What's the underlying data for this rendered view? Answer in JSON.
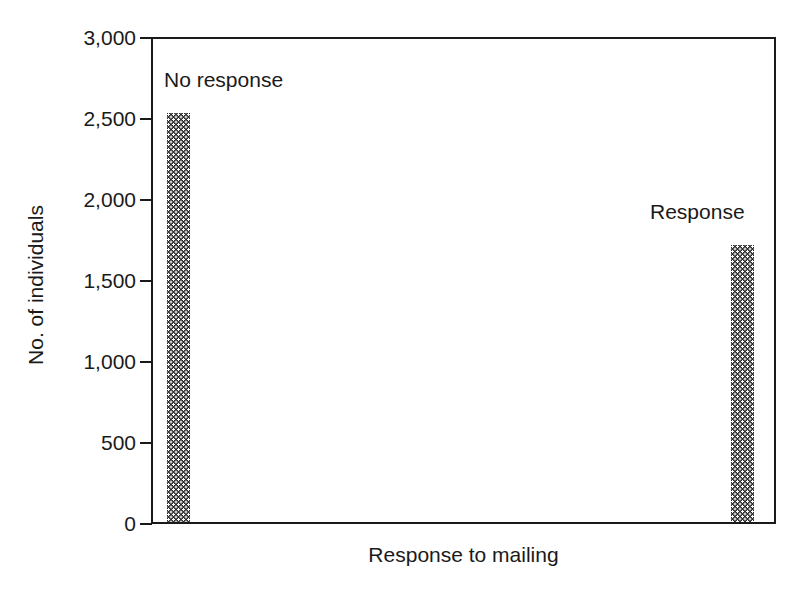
{
  "chart_data": {
    "type": "bar",
    "title": "",
    "subtitle": "",
    "xlabel": "Response to mailing",
    "ylabel": "No. of individuals",
    "categories": [
      "No response",
      "Response"
    ],
    "values": [
      2540,
      1720
    ],
    "ylim": [
      0,
      3000
    ],
    "yticks": [
      0,
      500,
      1000,
      1500,
      2000,
      2500,
      3000
    ],
    "ytick_labels": [
      "0",
      "500",
      "1,000",
      "1,500",
      "2,000",
      "2,500",
      "3,000"
    ],
    "xticks": [],
    "xtick_labels": [],
    "grid": false,
    "legend": "none",
    "annotations": [
      {
        "text": "No response",
        "for_bar": 0
      },
      {
        "text": "Response",
        "for_bar": 1
      }
    ],
    "bar_fill": "#2b2b2b",
    "axis_color": "#1a1a1a",
    "background": "#ffffff"
  }
}
